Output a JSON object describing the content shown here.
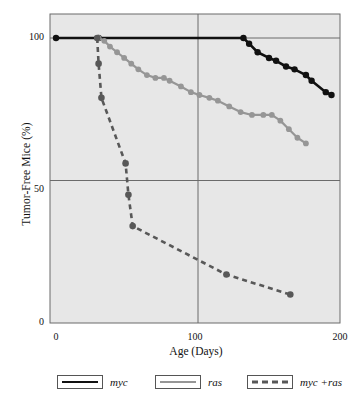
{
  "chart_data": {
    "type": "line",
    "title": "",
    "xlabel": "Age (Days)",
    "ylabel": "Tumor-Free Mice (%)",
    "xlim": [
      0,
      200
    ],
    "ylim": [
      0,
      100
    ],
    "xticks": [
      0,
      100,
      200
    ],
    "xtick_labels": [
      "0",
      "100",
      "200"
    ],
    "yticks": [
      0,
      50,
      100
    ],
    "ytick_labels": [
      "0",
      "50",
      "100"
    ],
    "grid": true,
    "legend_position": "below",
    "series": [
      {
        "name": "myc",
        "style": "solid",
        "color": "#111111",
        "x": [
          0,
          30,
          132,
          136,
          142,
          150,
          155,
          162,
          168,
          176,
          180,
          190,
          194
        ],
        "y": [
          100,
          100,
          100,
          98,
          95,
          93,
          92,
          90,
          89,
          87,
          85,
          81,
          80
        ]
      },
      {
        "name": "ras",
        "style": "solid",
        "color": "#969696",
        "x": [
          30,
          34,
          38,
          43,
          48,
          53,
          58,
          64,
          70,
          76,
          80,
          88,
          95,
          101,
          108,
          114,
          122,
          130,
          138,
          146,
          152,
          158,
          164,
          170,
          176
        ],
        "y": [
          100,
          99,
          97,
          95,
          93,
          91,
          89,
          87,
          86,
          86,
          85,
          83,
          81,
          80,
          79,
          78,
          76,
          74,
          73,
          73,
          73,
          71,
          68,
          65,
          63
        ]
      },
      {
        "name": "myc +ras",
        "style": "dashed",
        "color": "#585858",
        "x": [
          29,
          30,
          32,
          49,
          51,
          54,
          120,
          165
        ],
        "y": [
          100,
          91,
          79,
          56,
          45,
          34,
          17,
          10
        ]
      }
    ]
  },
  "legend": {
    "entries": [
      {
        "label": "myc",
        "style": "solid",
        "color": "#111111"
      },
      {
        "label": "ras",
        "style": "solid",
        "color": "#969696"
      },
      {
        "label": "myc +ras",
        "style": "dashed",
        "color": "#585858"
      }
    ]
  },
  "colors": {
    "plot_background": "#e7e7e7",
    "plot_border": "#6b6b6b",
    "gridline": "#6b6b6b",
    "text": "#111111",
    "myc": "#111111",
    "ras": "#969696",
    "myc_ras": "#585858"
  }
}
